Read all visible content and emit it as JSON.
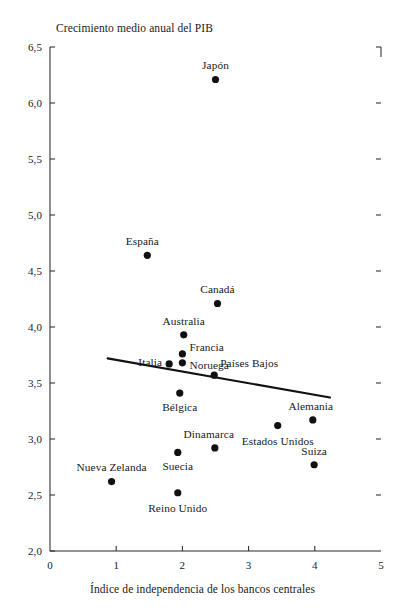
{
  "chart_data": {
    "type": "scatter",
    "title": "Crecimiento medio anual del PIB",
    "xlabel": "Índice de independencia de los bancos centrales",
    "ylabel": "Crecimiento medio anual del PIB",
    "xlim": [
      0,
      5
    ],
    "ylim": [
      2.0,
      6.5
    ],
    "xticks": [
      "0",
      "1",
      "2",
      "3",
      "4",
      "5"
    ],
    "xtick_values": [
      0,
      1,
      2,
      3,
      4,
      5
    ],
    "yticks": [
      "2,0",
      "2,5",
      "3,0",
      "3,5",
      "4,0",
      "4,5",
      "5,0",
      "5,5",
      "6,0",
      "6,5"
    ],
    "ytick_values": [
      2.0,
      2.5,
      3.0,
      3.5,
      4.0,
      4.5,
      5.0,
      5.5,
      6.0,
      6.5
    ],
    "grid": false,
    "legend": "none",
    "marker_color": "#111111",
    "points": [
      {
        "name": "Japón",
        "x": 2.5,
        "y": 6.21,
        "label_dx": 0,
        "label_dy": -13,
        "label_align": "center"
      },
      {
        "name": "España",
        "x": 1.47,
        "y": 4.64,
        "label_dx": -5,
        "label_dy": -13,
        "label_align": "center"
      },
      {
        "name": "Canadá",
        "x": 2.53,
        "y": 4.21,
        "label_dx": 0,
        "label_dy": -13,
        "label_align": "center"
      },
      {
        "name": "Australia",
        "x": 2.02,
        "y": 3.93,
        "label_dx": 0,
        "label_dy": -13,
        "label_align": "center"
      },
      {
        "name": "Francia",
        "x": 2.0,
        "y": 3.76,
        "label_dx": 7,
        "label_dy": -6,
        "label_align": "left"
      },
      {
        "name": "Noruega",
        "x": 2.0,
        "y": 3.68,
        "label_dx": 7,
        "label_dy": 3,
        "label_align": "left"
      },
      {
        "name": "Italia",
        "x": 1.8,
        "y": 3.67,
        "label_dx": -7,
        "label_dy": -1,
        "label_align": "right"
      },
      {
        "name": "Países Bajos",
        "x": 2.48,
        "y": 3.57,
        "label_dx": 6,
        "label_dy": -11,
        "label_align": "left"
      },
      {
        "name": "Bélgica",
        "x": 1.96,
        "y": 3.41,
        "label_dx": 0,
        "label_dy": 15,
        "label_align": "center"
      },
      {
        "name": "Alemania",
        "x": 3.97,
        "y": 3.17,
        "label_dx": -2,
        "label_dy": -13,
        "label_align": "center"
      },
      {
        "name": "Estados Unidos",
        "x": 3.44,
        "y": 3.12,
        "label_dx": 0,
        "label_dy": 16,
        "label_align": "center"
      },
      {
        "name": "Dinamarca",
        "x": 2.49,
        "y": 2.92,
        "label_dx": -6,
        "label_dy": -13,
        "label_align": "center"
      },
      {
        "name": "Suecia",
        "x": 1.93,
        "y": 2.88,
        "label_dx": 0,
        "label_dy": 15,
        "label_align": "center"
      },
      {
        "name": "Suiza",
        "x": 3.99,
        "y": 2.77,
        "label_dx": 0,
        "label_dy": -13,
        "label_align": "center"
      },
      {
        "name": "Nueva Zelanda",
        "x": 0.93,
        "y": 2.62,
        "label_dx": 0,
        "label_dy": -14,
        "label_align": "center"
      },
      {
        "name": "Reino Unido",
        "x": 1.93,
        "y": 2.52,
        "label_dx": 0,
        "label_dy": 16,
        "label_align": "center"
      }
    ],
    "trendline": {
      "x0": 0.87,
      "y0": 3.72,
      "x1": 4.23,
      "y1": 3.37,
      "color": "#111111"
    }
  }
}
